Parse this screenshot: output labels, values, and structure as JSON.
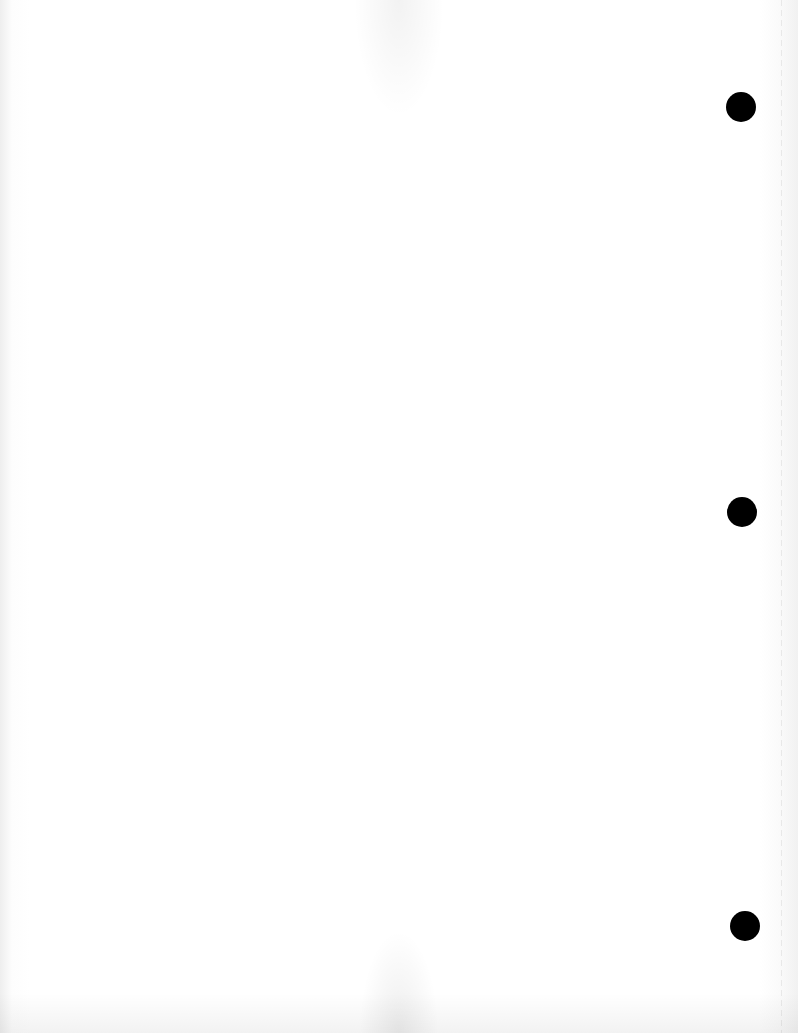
{
  "document": {
    "type": "blank scanned page",
    "text": "",
    "punch_holes": 3,
    "colors": {
      "paper": "#ffffff",
      "hole": "#000000"
    }
  }
}
